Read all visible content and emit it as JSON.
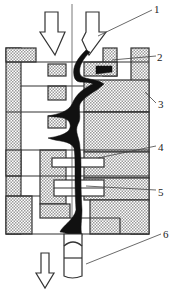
{
  "diagram": {
    "type": "cross-section",
    "colors": {
      "line": "#333333",
      "hatch_fill": "#cfcfcf",
      "channel": "#111111",
      "background": "#ffffff"
    },
    "arrows": [
      {
        "id": "inflow-left",
        "direction": "down"
      },
      {
        "id": "inflow-right",
        "direction": "down"
      },
      {
        "id": "outflow",
        "direction": "down"
      }
    ],
    "callouts": [
      {
        "number": "1",
        "x": 154,
        "y": 4
      },
      {
        "number": "2",
        "x": 157,
        "y": 52
      },
      {
        "number": "3",
        "x": 158,
        "y": 99
      },
      {
        "number": "4",
        "x": 158,
        "y": 142
      },
      {
        "number": "5",
        "x": 158,
        "y": 187
      },
      {
        "number": "6",
        "x": 163,
        "y": 229
      }
    ]
  }
}
